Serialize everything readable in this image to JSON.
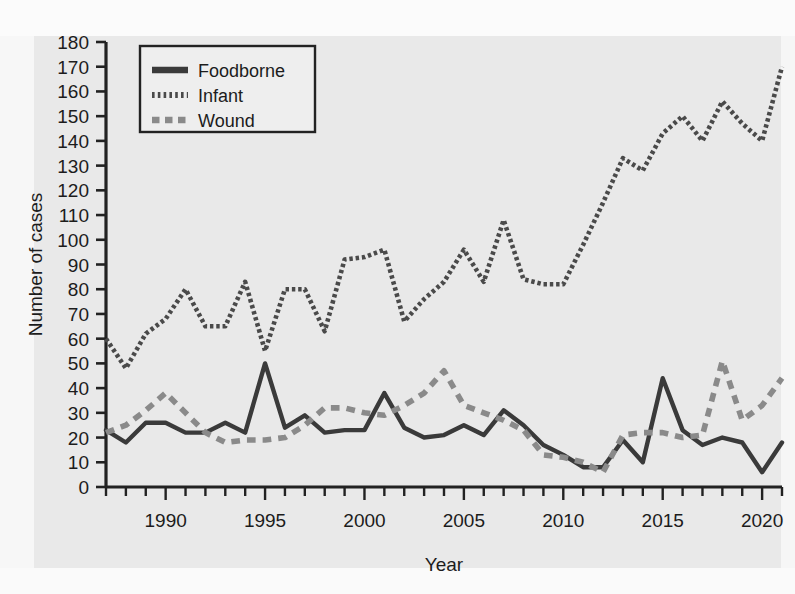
{
  "figure": {
    "background_color": "#e9e9e9",
    "page_color": "#fbfbfb",
    "ghost_text": "bleed-through text from reverse of scanned page"
  },
  "chart_data": {
    "type": "line",
    "title": "",
    "xlabel": "Year",
    "ylabel": "Number of cases",
    "xlim": [
      1987,
      2021
    ],
    "ylim": [
      0,
      180
    ],
    "y_ticks": [
      0,
      10,
      20,
      30,
      40,
      50,
      60,
      70,
      80,
      90,
      100,
      110,
      120,
      130,
      140,
      150,
      160,
      170,
      180
    ],
    "x_ticks_labeled": [
      1990,
      1995,
      2000,
      2005,
      2010,
      2015,
      2020
    ],
    "x_tick_step": 1,
    "grid": false,
    "legend_position": "top-left",
    "x": [
      1987,
      1988,
      1989,
      1990,
      1991,
      1992,
      1993,
      1994,
      1995,
      1996,
      1997,
      1998,
      1999,
      2000,
      2001,
      2002,
      2003,
      2004,
      2005,
      2006,
      2007,
      2008,
      2009,
      2010,
      2011,
      2012,
      2013,
      2014,
      2015,
      2016,
      2017,
      2018,
      2019,
      2020,
      2021
    ],
    "series": [
      {
        "name": "Foodborne",
        "style": "solid",
        "color": "#3a3a3a",
        "values": [
          23,
          18,
          26,
          26,
          22,
          22,
          26,
          22,
          50,
          24,
          29,
          22,
          23,
          23,
          38,
          24,
          20,
          21,
          25,
          21,
          31,
          25,
          17,
          13,
          8,
          8,
          19,
          10,
          44,
          23,
          17,
          20,
          18,
          6,
          18
        ]
      },
      {
        "name": "Infant",
        "style": "dotted",
        "color": "#4a4a4a",
        "values": [
          60,
          48,
          62,
          68,
          80,
          65,
          65,
          83,
          55,
          80,
          80,
          63,
          92,
          93,
          96,
          67,
          76,
          83,
          96,
          83,
          108,
          84,
          82,
          82,
          98,
          115,
          133,
          128,
          143,
          150,
          140,
          156,
          147,
          140,
          170
        ]
      },
      {
        "name": "Wound",
        "style": "dashed",
        "color": "#8a8a8a",
        "values": [
          22,
          25,
          31,
          38,
          30,
          22,
          18,
          19,
          19,
          20,
          25,
          32,
          32,
          30,
          29,
          33,
          38,
          47,
          33,
          30,
          27,
          23,
          13,
          12,
          10,
          6,
          21,
          22,
          22,
          20,
          21,
          51,
          27,
          33,
          44
        ]
      }
    ]
  },
  "legend": {
    "items": [
      {
        "label": "Foodborne",
        "swatch": "solid-line-swatch"
      },
      {
        "label": "Infant",
        "swatch": "dotted-line-swatch"
      },
      {
        "label": "Wound",
        "swatch": "dashed-line-swatch"
      }
    ]
  }
}
